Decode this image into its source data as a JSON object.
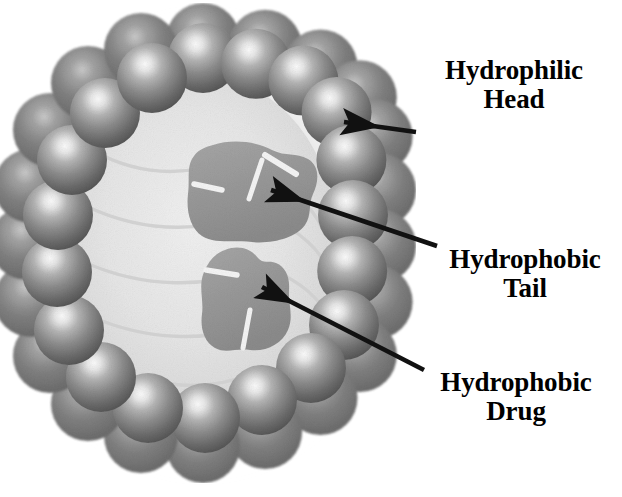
{
  "figure": {
    "kind": "micelle-cross-section-diagram",
    "title": "",
    "background_color": "#ffffff",
    "palette": {
      "sphere_mid": "#8e8e8e",
      "sphere_dark": "#4a4a4a",
      "sphere_highlight": "#f2f2f2",
      "back_layer": "#6f6f6f",
      "lumen": "#e3e3e3",
      "lumen_core": "#eeeeee",
      "drug_blob": "#9a9a9a",
      "tail_line": "#d2d2d2",
      "arrow": "#111111",
      "text": "#000000",
      "shadow": "#c9c9c9"
    }
  },
  "labels": [
    {
      "name": "hydrophilic-head",
      "line1": "Hydrophilic",
      "line2": "Head"
    },
    {
      "name": "hydrophobic-tail",
      "line1": "Hydrophobic",
      "line2": "Tail"
    },
    {
      "name": "hydrophobic-drug",
      "line1": "Hydrophobic",
      "line2": "Drug"
    }
  ],
  "arrows": [
    {
      "name": "arrow-to-hydrophilic-head",
      "from_label": "Hydrophilic Head",
      "points_to": "outer shell sphere (upper right of ring)",
      "tail_x": 416,
      "tail_y": 132,
      "tip_x": 338,
      "tip_y": 122
    },
    {
      "name": "arrow-to-hydrophobic-tail",
      "from_label": "Hydrophobic Tail",
      "points_to": "upper interior drug blob / tail region",
      "tail_x": 437,
      "tail_y": 246,
      "tip_x": 264,
      "tip_y": 188
    },
    {
      "name": "arrow-to-hydrophobic-drug",
      "from_label": "Hydrophobic Drug",
      "points_to": "lower interior drug blob",
      "tail_x": 424,
      "tail_y": 370,
      "tip_x": 255,
      "tip_y": 283
    }
  ],
  "structure": {
    "shell_sphere_count_front": 17,
    "shell_sphere_count_back": 17,
    "drug_blob_count": 2,
    "center_x": 203,
    "center_y": 243,
    "front_ring_radius_x": 150,
    "front_ring_radius_y": 185,
    "front_sphere_radius": 34,
    "back_ring_radius_x": 170,
    "back_ring_radius_y": 205,
    "back_sphere_radius": 36
  }
}
